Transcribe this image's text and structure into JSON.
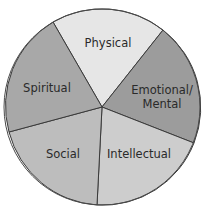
{
  "diagram": {
    "type": "pie-wheel",
    "center": [
      102,
      107
    ],
    "radius": 98,
    "outline_color": "#3a3a3a",
    "segments": [
      {
        "label": "Physical",
        "lines": [
          "Physical"
        ],
        "color": "#e6e6e6",
        "start": [
          53,
          22
        ],
        "end": [
          163,
          30
        ],
        "label_pos": [
          108,
          46
        ]
      },
      {
        "label": "Emotional/Mental",
        "lines": [
          "Emotional/",
          "Mental"
        ],
        "color": "#9c9c9c",
        "start": [
          163,
          30
        ],
        "end": [
          194,
          143
        ],
        "label_pos": [
          162,
          92
        ]
      },
      {
        "label": "Intellectual",
        "lines": [
          "Intellectual"
        ],
        "color": "#cdcdcd",
        "start": [
          194,
          143
        ],
        "end": [
          97,
          206
        ],
        "label_pos": [
          139,
          156
        ]
      },
      {
        "label": "Social",
        "lines": [
          "Social"
        ],
        "color": "#bdbdbd",
        "start": [
          97,
          206
        ],
        "end": [
          9,
          132
        ],
        "label_pos": [
          62,
          155
        ]
      },
      {
        "label": "Spiritual",
        "lines": [
          "Spiritual"
        ],
        "color": "#a8a8a8",
        "start": [
          9,
          132
        ],
        "end": [
          53,
          22
        ],
        "label_pos": [
          45,
          91
        ]
      }
    ]
  },
  "labels": {
    "physical": "Physical",
    "emotional_1": "Emotional/",
    "emotional_2": "Mental",
    "intellectual": "Intellectual",
    "social": "Social",
    "spiritual": "Spiritual"
  }
}
